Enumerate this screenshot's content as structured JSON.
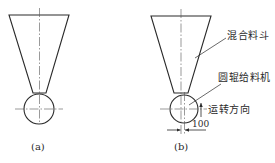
{
  "figure": {
    "panels": [
      {
        "id": "a",
        "caption": "(a)",
        "hopper": {
          "top_left": [
            9,
            15
          ],
          "top_right": [
            69,
            15
          ],
          "bottom_left": [
            33,
            93
          ],
          "bottom_right": [
            46,
            93
          ]
        },
        "roller": {
          "center": [
            39,
            109
          ],
          "radius": 15
        }
      },
      {
        "id": "b",
        "caption": "(b)",
        "hopper": {
          "top_left": [
            151,
            16
          ],
          "top_right": [
            211,
            16
          ],
          "bottom_left": [
            174,
            93
          ],
          "bottom_right": [
            188,
            93
          ]
        },
        "roller": {
          "center": [
            184,
            109
          ],
          "radius": 14
        },
        "labels": {
          "hopper": "混合料斗",
          "roller_feeder": "圆辊给料机",
          "rotation_direction": "运转方向",
          "offset_dimension": "100"
        }
      }
    ],
    "colors": {
      "line": "#2a2a2a",
      "background": "#ffffff"
    }
  }
}
